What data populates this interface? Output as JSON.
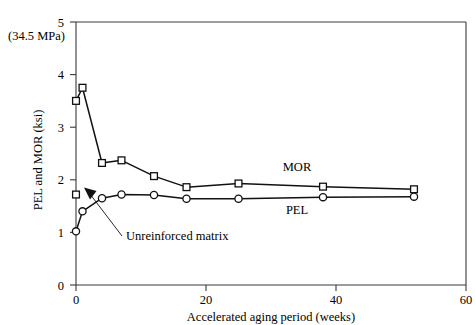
{
  "chart_data": {
    "type": "line",
    "title": "",
    "xlabel": "Accelerated aging period (weeks)",
    "ylabel": "PEL and MOR (ksi)",
    "xlim": [
      0,
      60
    ],
    "ylim": [
      0,
      5
    ],
    "xticks": [
      0,
      20,
      40,
      60
    ],
    "xtick_labels": [
      "0",
      "20",
      "40",
      "60"
    ],
    "yticks": [
      0,
      1,
      2,
      3,
      4,
      5
    ],
    "ytick_labels": [
      "0",
      "1",
      "2",
      "3",
      "4",
      "5"
    ],
    "grid": false,
    "legend_position": "inline-labels",
    "series": [
      {
        "name": "MOR",
        "marker": "square",
        "label": "MOR",
        "label_x": 34,
        "label_y": 2.22,
        "x": [
          0,
          1,
          4,
          7,
          12,
          17,
          25,
          38,
          52
        ],
        "y": [
          3.5,
          3.75,
          2.32,
          2.37,
          2.07,
          1.86,
          1.93,
          1.87,
          1.82
        ]
      },
      {
        "name": "PEL",
        "marker": "circle",
        "label": "PEL",
        "label_x": 34,
        "label_y": 1.32,
        "x": [
          0,
          1,
          4,
          7,
          12,
          17,
          25,
          38,
          52
        ],
        "y": [
          1.02,
          1.4,
          1.65,
          1.72,
          1.71,
          1.64,
          1.64,
          1.67,
          1.68
        ]
      }
    ],
    "annotations": [
      {
        "text": "Unreinforced matrix",
        "marker": "square",
        "point_x": 0,
        "point_y": 1.72,
        "text_x": 9.5,
        "text_y": 0.94
      },
      {
        "text": "(34.5 MPa)",
        "corner": "top-left"
      }
    ]
  },
  "axis": {
    "y_title": "PEL and MOR (ksi)",
    "x_title": "Accelerated aging period (weeks)",
    "corner_note": "(34.5 MPa)",
    "x_tick_labels": [
      "0",
      "20",
      "40",
      "60"
    ],
    "y_tick_labels": [
      "0",
      "1",
      "2",
      "3",
      "4",
      "5"
    ]
  },
  "labels": {
    "mor": "MOR",
    "pel": "PEL",
    "unreinforced": "Unreinforced matrix"
  },
  "colors": {
    "line": "#111111",
    "axis": "#3a3a3a",
    "marker_fill": "#ffffff",
    "background": "#ffffff"
  }
}
